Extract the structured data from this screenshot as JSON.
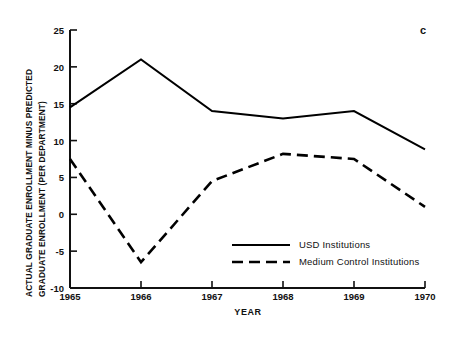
{
  "panel": {
    "label": "c"
  },
  "chart_data": {
    "type": "line",
    "title": "",
    "xlabel": "YEAR",
    "ylabel": "ACTUAL GRADUATE ENROLLMENT MINUS PREDICTED GRADUATE ENROLLMENT (PER DEPARTMENT)",
    "ylabel_lines": [
      "ACTUAL GRADUATE ENROLLMENT MINUS PREDICTED",
      "GRADUATE ENROLLMENT (PER DEPARTMENT)"
    ],
    "categories": [
      1965,
      1966,
      1967,
      1968,
      1969,
      1970
    ],
    "x": [
      1965,
      1966,
      1967,
      1968,
      1969,
      1970
    ],
    "xlim": [
      1965,
      1970
    ],
    "ylim": [
      -10,
      25
    ],
    "yticks": [
      25,
      20,
      15,
      10,
      5,
      0,
      -5,
      -10
    ],
    "ytick_labels": [
      "25",
      "20",
      "15",
      "10",
      "5",
      "0",
      "-5",
      "-10"
    ],
    "xticks": [
      1965,
      1966,
      1967,
      1968,
      1969,
      1970
    ],
    "xtick_labels": [
      "1965",
      "1966",
      "1967",
      "1968",
      "1969",
      "1970"
    ],
    "grid": false,
    "legend_position": "lower-center-right",
    "series": [
      {
        "name": "USD Institutions",
        "style": "solid",
        "color": "#000000",
        "values": [
          14.5,
          21.0,
          14.0,
          13.0,
          14.0,
          8.8
        ]
      },
      {
        "name": "Medium Control Institutions",
        "style": "dashed",
        "color": "#000000",
        "values": [
          7.5,
          -6.5,
          4.5,
          8.2,
          7.5,
          1.0
        ]
      }
    ]
  }
}
